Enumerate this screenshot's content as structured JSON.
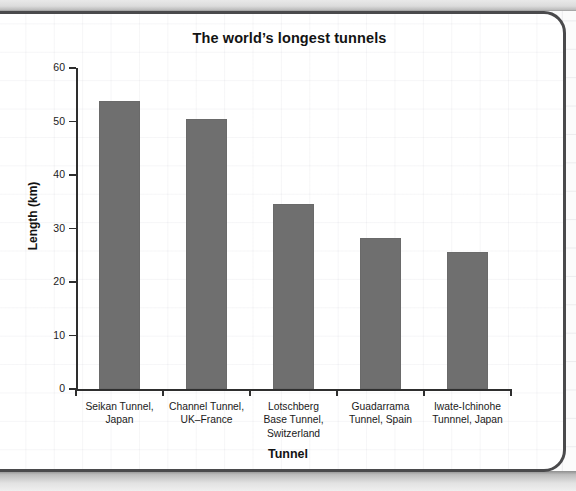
{
  "chart_data": {
    "type": "bar",
    "title": "The world’s longest tunnels",
    "xlabel": "Tunnel",
    "ylabel": "Length (km)",
    "ylim": [
      0,
      60
    ],
    "ytick_labels": [
      "0",
      "10",
      "20",
      "30",
      "40",
      "50",
      "60"
    ],
    "ytick_values": [
      0,
      10,
      20,
      30,
      40,
      50,
      60
    ],
    "grid": false,
    "legend": "none",
    "bar_color": "#6f6f6f",
    "categories": [
      "Seikan Tunnel, Japan",
      "Channel Tunnel, UK–France",
      "Lotschberg Base Tunnel, Switzerland",
      "Guadarrama Tunnel, Spain",
      "Iwate-Ichinohe Tunnnel, Japan"
    ],
    "category_lines": [
      [
        "Seikan Tunnel,",
        "Japan"
      ],
      [
        "Channel Tunnel,",
        "UK–France"
      ],
      [
        "Lotschberg",
        "Base Tunnel,",
        "Switzerland"
      ],
      [
        "Guadarrama",
        "Tunnel, Spain"
      ],
      [
        "Iwate-Ichinohe",
        "Tunnnel, Japan"
      ]
    ],
    "values": [
      53.8,
      50.4,
      34.6,
      28.3,
      25.7
    ]
  },
  "colors": {
    "bar": "#6f6f6f",
    "axis": "#2e2e2e",
    "text": "#131313",
    "card_border": "#4a4a4c",
    "card_background": "#ffffff",
    "page_background": "#fbfbfb"
  }
}
